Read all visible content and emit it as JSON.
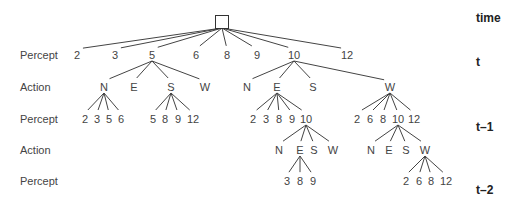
{
  "diagram": {
    "root": {
      "shape": "square",
      "x": 222,
      "y": 22
    },
    "row_labels": [
      {
        "text": "Percept",
        "y": 55
      },
      {
        "text": "Action",
        "y": 87
      },
      {
        "text": "Percept",
        "y": 119
      },
      {
        "text": "Action",
        "y": 150
      },
      {
        "text": "Percept",
        "y": 181
      }
    ],
    "time_labels": [
      {
        "text": "time",
        "y": 18
      },
      {
        "text": "t",
        "y": 62
      },
      {
        "text": "t–1",
        "y": 127
      },
      {
        "text": "t–2",
        "y": 190
      }
    ],
    "nodes": [
      {
        "id": "p2",
        "label": "2",
        "x": 77,
        "y": 55,
        "parent": "root"
      },
      {
        "id": "p3",
        "label": "3",
        "x": 115,
        "y": 55,
        "parent": "root"
      },
      {
        "id": "p5",
        "label": "5",
        "x": 152,
        "y": 55,
        "parent": "root"
      },
      {
        "id": "p6",
        "label": "6",
        "x": 196,
        "y": 55,
        "parent": "root"
      },
      {
        "id": "p8",
        "label": "8",
        "x": 227,
        "y": 55,
        "parent": "root"
      },
      {
        "id": "p9",
        "label": "9",
        "x": 257,
        "y": 55,
        "parent": "root"
      },
      {
        "id": "p10",
        "label": "10",
        "x": 294,
        "y": 55,
        "parent": "root"
      },
      {
        "id": "p12",
        "label": "12",
        "x": 347,
        "y": 55,
        "parent": "root"
      },
      {
        "id": "p5N",
        "label": "N",
        "x": 104,
        "y": 87,
        "parent": "p5"
      },
      {
        "id": "p5E",
        "label": "E",
        "x": 134,
        "y": 87,
        "parent": "p5"
      },
      {
        "id": "p5S",
        "label": "S",
        "x": 171,
        "y": 87,
        "parent": "p5"
      },
      {
        "id": "p5W",
        "label": "W",
        "x": 205,
        "y": 87,
        "parent": "p5"
      },
      {
        "id": "p10N",
        "label": "N",
        "x": 247,
        "y": 87,
        "parent": "p10"
      },
      {
        "id": "p10E",
        "label": "E",
        "x": 277,
        "y": 87,
        "parent": "p10"
      },
      {
        "id": "p10S",
        "label": "S",
        "x": 313,
        "y": 87,
        "parent": "p10"
      },
      {
        "id": "p10W",
        "label": "W",
        "x": 390,
        "y": 87,
        "parent": "p10"
      },
      {
        "id": "nN2",
        "label": "2",
        "x": 85,
        "y": 119,
        "parent": "p5N"
      },
      {
        "id": "nN3",
        "label": "3",
        "x": 97,
        "y": 119,
        "parent": "p5N"
      },
      {
        "id": "nN5",
        "label": "5",
        "x": 109,
        "y": 119,
        "parent": "p5N"
      },
      {
        "id": "nN6",
        "label": "6",
        "x": 121,
        "y": 119,
        "parent": "p5N"
      },
      {
        "id": "nS5",
        "label": "5",
        "x": 153,
        "y": 119,
        "parent": "p5S"
      },
      {
        "id": "nS8",
        "label": "8",
        "x": 165,
        "y": 119,
        "parent": "p5S"
      },
      {
        "id": "nS9",
        "label": "9",
        "x": 178,
        "y": 119,
        "parent": "p5S"
      },
      {
        "id": "nS12",
        "label": "12",
        "x": 193,
        "y": 119,
        "parent": "p5S"
      },
      {
        "id": "eE2",
        "label": "2",
        "x": 253,
        "y": 119,
        "parent": "p10E"
      },
      {
        "id": "eE3",
        "label": "3",
        "x": 266,
        "y": 119,
        "parent": "p10E"
      },
      {
        "id": "eE8",
        "label": "8",
        "x": 279,
        "y": 119,
        "parent": "p10E"
      },
      {
        "id": "eE9",
        "label": "9",
        "x": 292,
        "y": 119,
        "parent": "p10E"
      },
      {
        "id": "eE10",
        "label": "10",
        "x": 306,
        "y": 119,
        "parent": "p10E"
      },
      {
        "id": "wW2",
        "label": "2",
        "x": 357,
        "y": 119,
        "parent": "p10W"
      },
      {
        "id": "wW6",
        "label": "6",
        "x": 370,
        "y": 119,
        "parent": "p10W"
      },
      {
        "id": "wW8",
        "label": "8",
        "x": 383,
        "y": 119,
        "parent": "p10W"
      },
      {
        "id": "wW10",
        "label": "10",
        "x": 398,
        "y": 119,
        "parent": "p10W"
      },
      {
        "id": "wW12",
        "label": "12",
        "x": 414,
        "y": 119,
        "parent": "p10W"
      },
      {
        "id": "aEN",
        "label": "N",
        "x": 279,
        "y": 150,
        "parent": "eE10"
      },
      {
        "id": "aEE",
        "label": "E",
        "x": 300,
        "y": 150,
        "parent": "eE10"
      },
      {
        "id": "aES",
        "label": "S",
        "x": 314,
        "y": 150,
        "parent": "eE10"
      },
      {
        "id": "aEW",
        "label": "W",
        "x": 333,
        "y": 150,
        "parent": "eE10"
      },
      {
        "id": "aWN",
        "label": "N",
        "x": 371,
        "y": 150,
        "parent": "wW10"
      },
      {
        "id": "aWE",
        "label": "E",
        "x": 389,
        "y": 150,
        "parent": "wW10"
      },
      {
        "id": "aWS",
        "label": "S",
        "x": 406,
        "y": 150,
        "parent": "wW10"
      },
      {
        "id": "aWW",
        "label": "W",
        "x": 425,
        "y": 150,
        "parent": "wW10"
      },
      {
        "id": "q3",
        "label": "3",
        "x": 287,
        "y": 181,
        "parent": "aEE"
      },
      {
        "id": "q8",
        "label": "8",
        "x": 300,
        "y": 181,
        "parent": "aEE"
      },
      {
        "id": "q9",
        "label": "9",
        "x": 313,
        "y": 181,
        "parent": "aEE"
      },
      {
        "id": "r2",
        "label": "2",
        "x": 406,
        "y": 181,
        "parent": "aWW"
      },
      {
        "id": "r6",
        "label": "6",
        "x": 419,
        "y": 181,
        "parent": "aWW"
      },
      {
        "id": "r8",
        "label": "8",
        "x": 431,
        "y": 181,
        "parent": "aWW"
      },
      {
        "id": "r12",
        "label": "12",
        "x": 446,
        "y": 181,
        "parent": "aWW"
      }
    ]
  }
}
